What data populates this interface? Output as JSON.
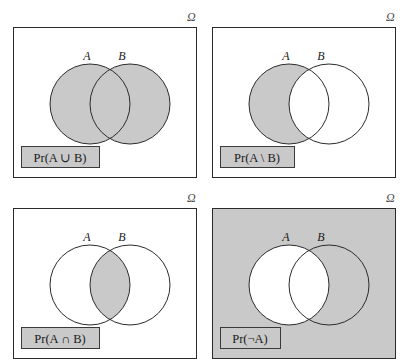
{
  "figure": {
    "type": "venn-diagram-grid",
    "rows": 2,
    "columns": 2,
    "universe_symbol": "Ω",
    "shade_color": "#c9c9c9",
    "outline_color": "#2b2b2b",
    "background_color": "#ffffff",
    "label_box_fill": "#c9c9c9",
    "label_box_border": "#3a3a3a"
  },
  "panels": [
    {
      "id": "pr-a-union-b",
      "position": "top-left",
      "universe_symbol": "Ω",
      "set_a_label": "A",
      "set_b_label": "B",
      "formula": "Pr(A ∪ B)",
      "formula_parts": {
        "prefix": "Pr(",
        "left_operand": "A",
        "operator": "∪",
        "right_operand": "B",
        "suffix": ")"
      },
      "operation": "union",
      "shaded_regions": [
        "A only",
        "A ∩ B",
        "B only"
      ],
      "universe_shaded": false,
      "label_box_filled": true
    },
    {
      "id": "pr-a-minus-b",
      "position": "top-right",
      "universe_symbol": "Ω",
      "set_a_label": "A",
      "set_b_label": "B",
      "formula": "Pr(A \\ B)",
      "formula_parts": {
        "prefix": "Pr(",
        "left_operand": "A",
        "operator": "\\",
        "right_operand": "B",
        "suffix": ")"
      },
      "operation": "difference",
      "shaded_regions": [
        "A only"
      ],
      "universe_shaded": false,
      "label_box_filled": true
    },
    {
      "id": "pr-a-intersect-b",
      "position": "bottom-left",
      "universe_symbol": "Ω",
      "set_a_label": "A",
      "set_b_label": "B",
      "formula": "Pr(A ∩ B)",
      "formula_parts": {
        "prefix": "Pr(",
        "left_operand": "A",
        "operator": "∩",
        "right_operand": "B",
        "suffix": ")"
      },
      "operation": "intersection",
      "shaded_regions": [
        "A ∩ B"
      ],
      "universe_shaded": false,
      "label_box_filled": true
    },
    {
      "id": "pr-not-a",
      "position": "bottom-right",
      "universe_symbol": "Ω",
      "set_a_label": "A",
      "set_b_label": "B",
      "formula": "Pr(¬A)",
      "formula_parts": {
        "prefix": "Pr(",
        "left_operand": "¬",
        "operator": "",
        "right_operand": "A",
        "suffix": ")"
      },
      "operation": "complement",
      "shaded_regions": [
        "Ω outside A",
        "B only"
      ],
      "universe_shaded": true,
      "label_box_filled": false
    }
  ]
}
